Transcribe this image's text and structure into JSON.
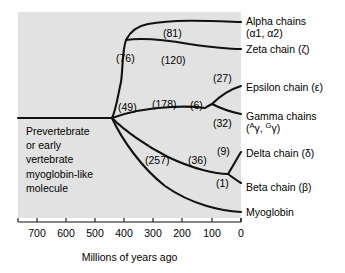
{
  "figure": {
    "background_color": "#ffffff",
    "panel_color": "#e2e2e2",
    "line_color": "#111111"
  },
  "axis": {
    "title": "Millions of years ago",
    "ticks": [
      {
        "label": "700",
        "value": 700,
        "x": 37
      },
      {
        "label": "600",
        "value": 600,
        "x": 66
      },
      {
        "label": "500",
        "value": 500,
        "x": 95
      },
      {
        "label": "400",
        "value": 400,
        "x": 124
      },
      {
        "label": "300",
        "value": 300,
        "x": 153
      },
      {
        "label": "200",
        "value": 200,
        "x": 182
      },
      {
        "label": "100",
        "value": 100,
        "x": 212
      },
      {
        "label": "0",
        "value": 0,
        "x": 241
      }
    ],
    "range": [
      760,
      0
    ],
    "y": 222
  },
  "root": {
    "text_lines": [
      "Prevertebrate",
      "or early",
      "vertebrate",
      "myoglobin-like",
      "molecule"
    ]
  },
  "tips": [
    {
      "id": "alpha",
      "name": "Alpha chains",
      "sub": "(α1, α2)",
      "label_x": 246,
      "label_y": 16
    },
    {
      "id": "zeta",
      "name": "Zeta chain (ζ)",
      "sub": "",
      "label_x": 246,
      "label_y": 44
    },
    {
      "id": "epsilon",
      "name": "Epsilon chain (ε)",
      "sub": "",
      "label_x": 246,
      "label_y": 82
    },
    {
      "id": "gamma",
      "name": "Gamma chains",
      "sub": "(ᴬγ, ᴳγ)",
      "label_x": 246,
      "label_y": 111
    },
    {
      "id": "delta",
      "name": "Delta chain (δ)",
      "sub": "",
      "label_x": 246,
      "label_y": 148
    },
    {
      "id": "beta",
      "name": "Beta chain (β)",
      "sub": "",
      "label_x": 246,
      "label_y": 182
    },
    {
      "id": "myoglobin",
      "name": "Myoglobin",
      "sub": "",
      "label_x": 246,
      "label_y": 207
    }
  ],
  "branch_labels": [
    {
      "id": "n81",
      "text": "(81)",
      "x": 163,
      "y": 28
    },
    {
      "id": "n76",
      "text": "(76)",
      "x": 116,
      "y": 53
    },
    {
      "id": "n120",
      "text": "(120)",
      "x": 161,
      "y": 55
    },
    {
      "id": "n27",
      "text": "(27)",
      "x": 213,
      "y": 73
    },
    {
      "id": "n49",
      "text": "(49)",
      "x": 118,
      "y": 102
    },
    {
      "id": "n178",
      "text": "(178)",
      "x": 152,
      "y": 99
    },
    {
      "id": "n6",
      "text": "(6)",
      "x": 190,
      "y": 100
    },
    {
      "id": "n32",
      "text": "(32)",
      "x": 213,
      "y": 118
    },
    {
      "id": "n9",
      "text": "(9)",
      "x": 217,
      "y": 146
    },
    {
      "id": "n257",
      "text": "(257)",
      "x": 145,
      "y": 155
    },
    {
      "id": "n36",
      "text": "(36)",
      "x": 188,
      "y": 155
    },
    {
      "id": "n1",
      "text": "(1)",
      "x": 216,
      "y": 178
    }
  ],
  "tree_paths": [
    {
      "id": "root-stem",
      "d": "M 18 118 L 112 118"
    },
    {
      "id": "branch-49-up",
      "d": "M 112 118 C 116 110 118 95 121 82 C 123 68 122 52 126 40"
    },
    {
      "id": "branch-76-fork",
      "d": "M 126 40 C 130 32 137 26 148 24 C 175 19 212 21 241 22"
    },
    {
      "id": "branch-120",
      "d": "M 126 40 C 140 38 166 40 189 44 C 210 47 228 49 241 49"
    },
    {
      "id": "branch-178",
      "d": "M 112 118 C 128 112 152 108 172 107 C 188 106 198 107 205 108"
    },
    {
      "id": "branch-6",
      "d": "M 205 108 C 208 106 210 105 212 104"
    },
    {
      "id": "branch-27",
      "d": "M 212 104 C 219 97 228 90 241 86"
    },
    {
      "id": "branch-32",
      "d": "M 212 104 C 220 108 230 112 241 114"
    },
    {
      "id": "branch-257",
      "d": "M 112 118 C 124 130 146 146 168 157 C 193 169 216 174 228 174"
    },
    {
      "id": "branch-9",
      "d": "M 228 174 C 232 168 236 160 241 152"
    },
    {
      "id": "branch-1",
      "d": "M 228 174 C 232 177 236 180 241 183"
    },
    {
      "id": "branch-myo",
      "d": "M 112 118 C 122 140 142 168 165 186 C 192 205 222 211 241 212"
    }
  ]
}
